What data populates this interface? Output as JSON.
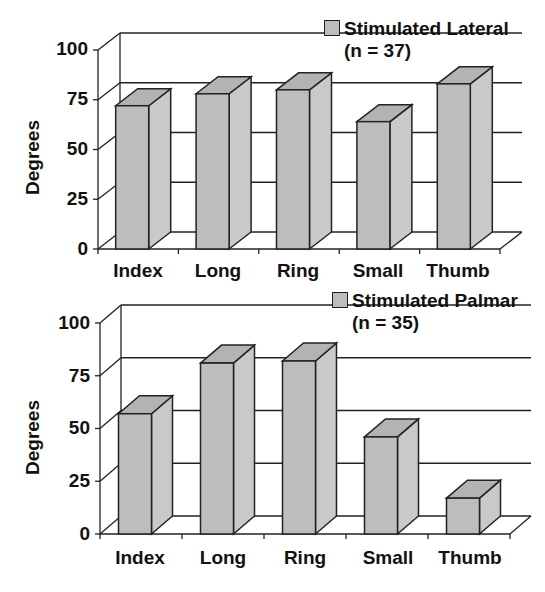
{
  "chart_data": [
    {
      "type": "bar",
      "title": "",
      "legend": [
        "Stimulated Lateral",
        "(n = 37)"
      ],
      "legend_position": "top-right",
      "xlabel": "",
      "ylabel": "Degrees",
      "ylim": [
        0,
        100
      ],
      "yticks": [
        "0",
        "25",
        "50",
        "75",
        "100"
      ],
      "grid": true,
      "style": "3d",
      "categories": [
        "Index",
        "Long",
        "Ring",
        "Small",
        "Thumb"
      ],
      "series": [
        {
          "name": "Stimulated Lateral (n = 37)",
          "values": [
            72,
            78,
            80,
            64,
            83
          ]
        }
      ]
    },
    {
      "type": "bar",
      "title": "",
      "legend": [
        "Stimulated Palmar",
        "(n = 35)"
      ],
      "legend_position": "top-right",
      "xlabel": "",
      "ylabel": "Degrees",
      "ylim": [
        0,
        100
      ],
      "yticks": [
        "0",
        "25",
        "50",
        "75",
        "100"
      ],
      "grid": true,
      "style": "3d",
      "categories": [
        "Index",
        "Long",
        "Ring",
        "Small",
        "Thumb"
      ],
      "series": [
        {
          "name": "Stimulated Palmar (n = 35)",
          "values": [
            57,
            81,
            82,
            46,
            17
          ]
        }
      ]
    }
  ],
  "colors": {
    "bar_face": "#bdbdbd",
    "bar_side": "#c9c9c9",
    "bar_top": "#b3b3b3",
    "line": "#222222"
  }
}
